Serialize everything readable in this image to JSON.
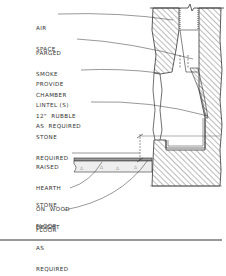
{
  "diagram": {
    "labels": [
      {
        "id": "air-space",
        "lines": [
          "AIR",
          "SPACE"
        ]
      },
      {
        "id": "parged-smoke-chamber",
        "lines": [
          "PARGED",
          "SMOKE",
          "CHAMBER"
        ]
      },
      {
        "id": "provide-lintel",
        "lines": [
          "PROVIDE",
          "LINTEL (S)",
          "AS  REQUIRED"
        ]
      },
      {
        "id": "rubble-stone",
        "lines": [
          "12\"  RUBBLE",
          "STONE",
          "REQUIRED"
        ]
      },
      {
        "id": "raised-hearth",
        "lines": [
          "RAISED",
          "HEARTH",
          "ON  WOOD",
          "FLOOR"
        ]
      },
      {
        "id": "stone-floor",
        "lines": [
          "STONE",
          "FLOOR"
        ]
      },
      {
        "id": "height",
        "lines": [
          "HEIGHT",
          "AS",
          "REQUIRED"
        ]
      }
    ],
    "colors": {
      "line": "#333333",
      "hatch": "#555555",
      "background": "#ffffff"
    }
  }
}
